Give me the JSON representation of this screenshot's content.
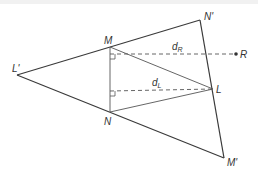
{
  "diagram": {
    "labels": {
      "M": "M",
      "N": "N",
      "L": "L",
      "L_prime": "L'",
      "M_prime": "M'",
      "N_prime": "N'",
      "R": "R",
      "d": "d",
      "d_R_sub": "R",
      "d_L_sub": "L"
    },
    "colors": {
      "line": "#3a3a3a",
      "dashed": "#555555",
      "text": "#333333",
      "background": "#ffffff"
    },
    "points": {
      "M": [
        110,
        47
      ],
      "N": [
        110,
        112
      ],
      "L": [
        213,
        89
      ],
      "L_prime": [
        17,
        75
      ],
      "M_prime": [
        224,
        158
      ],
      "N_prime": [
        200,
        20
      ],
      "R": [
        236,
        54
      ]
    }
  }
}
